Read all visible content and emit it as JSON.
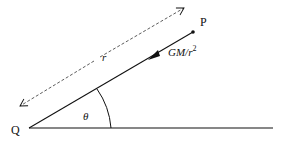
{
  "diagram": {
    "labels": {
      "point_p": "P",
      "point_q": "Q",
      "distance": "r",
      "angle": "θ",
      "force_main": "GM/r",
      "force_exp": "2"
    },
    "colors": {
      "line": "#111111",
      "background": "#ffffff"
    }
  }
}
